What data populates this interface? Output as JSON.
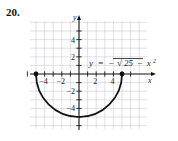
{
  "problem": {
    "number": "20."
  },
  "chart_data": {
    "type": "line",
    "title": "",
    "equation_label": "y = -√(25 - x²)",
    "equation_parts": {
      "y": "y",
      "equals": "=",
      "minus": "−",
      "radicand_left": "25",
      "radicand_minus": "−",
      "radicand_var": "x",
      "radicand_exp": "2"
    },
    "xlabel": "x",
    "ylabel": "y",
    "xlim": [
      -6.5,
      7.5
    ],
    "ylim": [
      -6.5,
      6.0
    ],
    "xticks": [
      -6,
      -5,
      -4,
      -3,
      -2,
      -1,
      1,
      2,
      3,
      4,
      5,
      6
    ],
    "yticks": [
      -6,
      -5,
      -4,
      -3,
      -2,
      -1,
      1,
      2,
      3,
      4,
      5
    ],
    "xtick_labels": [
      {
        "value": -4,
        "text": "−4"
      },
      {
        "value": -2,
        "text": "−2"
      },
      {
        "value": 2,
        "text": "2"
      },
      {
        "value": 4,
        "text": "4"
      }
    ],
    "ytick_labels": [
      {
        "value": 4,
        "text": "4"
      },
      {
        "value": 2,
        "text": "2"
      },
      {
        "value": -2,
        "text": "−2"
      },
      {
        "value": -4,
        "text": "−4"
      }
    ],
    "grid": true,
    "grid_color": "#c9c9d6",
    "curve_color": "#111111",
    "series": [
      {
        "name": "y = -sqrt(25 - x^2)",
        "kind": "lower-semicircle",
        "center": [
          0,
          0
        ],
        "radius": 5,
        "domain": [
          -5,
          5
        ],
        "range": [
          -5,
          0
        ],
        "x": [
          -5,
          -4.5,
          -4,
          -3.5,
          -3,
          -2.5,
          -2,
          -1.5,
          -1,
          -0.5,
          0,
          0.5,
          1,
          1.5,
          2,
          2.5,
          3,
          3.5,
          4,
          4.5,
          5
        ],
        "y": [
          0,
          -2.18,
          -3,
          -3.57,
          -4,
          -4.33,
          -4.58,
          -4.77,
          -4.9,
          -4.97,
          -5,
          -4.97,
          -4.9,
          -4.77,
          -4.58,
          -4.33,
          -4,
          -3.57,
          -3,
          -2.18,
          0
        ]
      }
    ],
    "endpoints": [
      {
        "point": [
          -5,
          0
        ],
        "style": "filled"
      },
      {
        "point": [
          5,
          0
        ],
        "style": "filled"
      }
    ],
    "legend": "none"
  }
}
